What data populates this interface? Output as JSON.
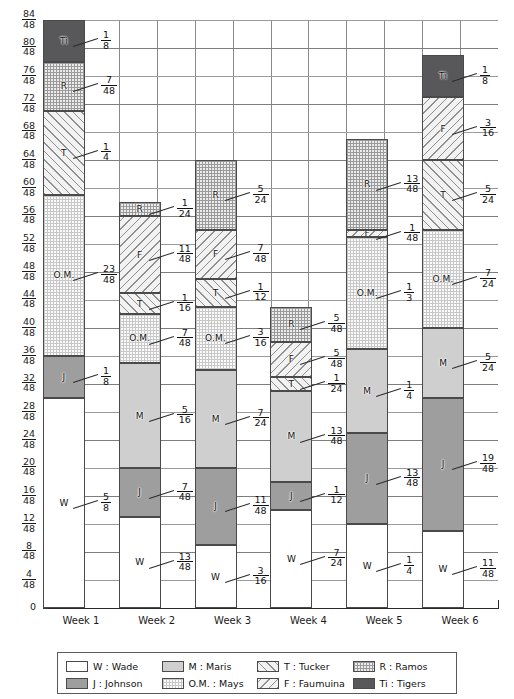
{
  "chart_data": {
    "type": "bar",
    "subtype": "stacked-bar",
    "title": "",
    "xlabel": "",
    "ylabel": "",
    "categories": [
      "Week 1",
      "Week 2",
      "Week 3",
      "Week 4",
      "Week 5",
      "Week 6"
    ],
    "ylim": [
      0,
      1.75
    ],
    "y_tick_labels": [
      {
        "num": "84",
        "den": "48",
        "value": 1.75
      },
      {
        "num": "80",
        "den": "48",
        "value": 1.6667
      },
      {
        "num": "76",
        "den": "48",
        "value": 1.5833
      },
      {
        "num": "72",
        "den": "48",
        "value": 1.5
      },
      {
        "num": "68",
        "den": "48",
        "value": 1.4167
      },
      {
        "num": "64",
        "den": "48",
        "value": 1.3333
      },
      {
        "num": "60",
        "den": "48",
        "value": 1.25
      },
      {
        "num": "56",
        "den": "48",
        "value": 1.1667
      },
      {
        "num": "52",
        "den": "48",
        "value": 1.0833
      },
      {
        "num": "48",
        "den": "48",
        "value": 1.0
      },
      {
        "num": "44",
        "den": "48",
        "value": 0.9167
      },
      {
        "num": "40",
        "den": "48",
        "value": 0.8333
      },
      {
        "num": "36",
        "den": "48",
        "value": 0.75
      },
      {
        "num": "32",
        "den": "48",
        "value": 0.6667
      },
      {
        "num": "28",
        "den": "48",
        "value": 0.5833
      },
      {
        "num": "24",
        "den": "48",
        "value": 0.5
      },
      {
        "num": "20",
        "den": "48",
        "value": 0.4167
      },
      {
        "num": "16",
        "den": "48",
        "value": 0.3333
      },
      {
        "num": "12",
        "den": "48",
        "value": 0.25
      },
      {
        "num": "8",
        "den": "48",
        "value": 0.1667
      },
      {
        "num": "4",
        "den": "48",
        "value": 0.0833
      },
      {
        "num": "0",
        "den": "",
        "value": 0
      }
    ],
    "grid": true,
    "legend_position": "bottom",
    "series": [
      {
        "key": "W",
        "name": "W : Wade",
        "short": "W",
        "values": [
          0.625,
          0.270833,
          0.1875,
          0.291667,
          0.25,
          0.229167
        ],
        "labels": [
          {
            "num": "5",
            "den": "8"
          },
          {
            "num": "13",
            "den": "48"
          },
          {
            "num": "3",
            "den": "16"
          },
          {
            "num": "7",
            "den": "24"
          },
          {
            "num": "1",
            "den": "4"
          },
          {
            "num": "11",
            "den": "48"
          }
        ]
      },
      {
        "key": "J",
        "name": "J : Johnson",
        "short": "J",
        "values": [
          0.125,
          0.145833,
          0.229167,
          0.083333,
          0.270833,
          0.395833
        ],
        "labels": [
          {
            "num": "1",
            "den": "8"
          },
          {
            "num": "7",
            "den": "48"
          },
          {
            "num": "11",
            "den": "48"
          },
          {
            "num": "1",
            "den": "12"
          },
          {
            "num": "13",
            "den": "48"
          },
          {
            "num": "19",
            "den": "48"
          }
        ]
      },
      {
        "key": "M",
        "name": "M : Maris",
        "short": "M",
        "values": [
          0,
          0.3125,
          0.291667,
          0.270833,
          0.25,
          0.208333
        ],
        "labels": [
          null,
          {
            "num": "5",
            "den": "16"
          },
          {
            "num": "7",
            "den": "24"
          },
          {
            "num": "13",
            "den": "48"
          },
          {
            "num": "1",
            "den": "4"
          },
          {
            "num": "5",
            "den": "24"
          }
        ]
      },
      {
        "key": "OM",
        "name": "O.M. : Mays",
        "short": "O.M.",
        "values": [
          0.479167,
          0.145833,
          0.1875,
          0,
          0.333333,
          0.291667
        ],
        "labels": [
          {
            "num": "23",
            "den": "48"
          },
          {
            "num": "7",
            "den": "48"
          },
          {
            "num": "3",
            "den": "16"
          },
          null,
          {
            "num": "1",
            "den": "3"
          },
          {
            "num": "7",
            "den": "24"
          }
        ]
      },
      {
        "key": "T",
        "name": "T : Tucker",
        "short": "T",
        "values": [
          0.25,
          0.0625,
          0.083333,
          0.041667,
          0,
          0.208333
        ],
        "labels": [
          {
            "num": "1",
            "den": "4"
          },
          {
            "num": "1",
            "den": "16"
          },
          {
            "num": "1",
            "den": "12"
          },
          {
            "num": "1",
            "den": "24"
          },
          null,
          {
            "num": "5",
            "den": "24"
          }
        ]
      },
      {
        "key": "F",
        "name": "F : Faumuina",
        "short": "F",
        "values": [
          0,
          0.229167,
          0.145833,
          0.104167,
          0.020833,
          0.1875
        ],
        "labels": [
          null,
          {
            "num": "11",
            "den": "48"
          },
          {
            "num": "7",
            "den": "48"
          },
          {
            "num": "5",
            "den": "48"
          },
          {
            "num": "1",
            "den": "48"
          },
          {
            "num": "3",
            "den": "16"
          }
        ]
      },
      {
        "key": "R",
        "name": "R : Ramos",
        "short": "R",
        "values": [
          0.145833,
          0.041667,
          0.208333,
          0.104167,
          0.270833,
          0
        ],
        "labels": [
          {
            "num": "7",
            "den": "48"
          },
          {
            "num": "1",
            "den": "24"
          },
          {
            "num": "5",
            "den": "24"
          },
          {
            "num": "5",
            "den": "48"
          },
          {
            "num": "13",
            "den": "48"
          },
          null
        ]
      },
      {
        "key": "Ti",
        "name": "Ti : Tigers",
        "short": "Ti",
        "values": [
          0.125,
          0,
          0,
          0,
          0,
          0.125
        ],
        "labels": [
          {
            "num": "1",
            "den": "8"
          },
          null,
          null,
          null,
          null,
          {
            "num": "1",
            "den": "8"
          }
        ]
      }
    ],
    "totals": [
      1.75,
      1.208333,
      1.333333,
      0.895833,
      1.395833,
      1.645833
    ]
  },
  "legend": {
    "items": [
      {
        "key": "W",
        "label": "W : Wade"
      },
      {
        "key": "M",
        "label": "M : Maris"
      },
      {
        "key": "T",
        "label": "T : Tucker"
      },
      {
        "key": "R",
        "label": "R : Ramos"
      },
      {
        "key": "J",
        "label": "J : Johnson"
      },
      {
        "key": "OM",
        "label": "O.M. : Mays"
      },
      {
        "key": "F",
        "label": "F : Faumuina"
      },
      {
        "key": "Ti",
        "label": "Ti : Tigers"
      }
    ]
  }
}
